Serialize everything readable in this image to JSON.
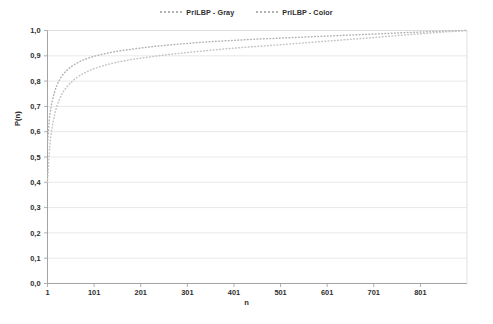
{
  "chart_data": {
    "type": "line",
    "title": "",
    "xlabel": "n",
    "ylabel": "P(n)",
    "xlim": [
      1,
      901
    ],
    "ylim": [
      0.0,
      1.0
    ],
    "grid": "horizontal",
    "legend_position": "top-center",
    "xticks": [
      "1",
      "101",
      "201",
      "301",
      "401",
      "501",
      "601",
      "701",
      "801"
    ],
    "xtick_values": [
      1,
      101,
      201,
      301,
      401,
      501,
      601,
      701,
      801
    ],
    "yticks": [
      "0,0",
      "0,1",
      "0,2",
      "0,3",
      "0,4",
      "0,5",
      "0,6",
      "0,7",
      "0,8",
      "0,9",
      "1,0"
    ],
    "ytick_values": [
      0.0,
      0.1,
      0.2,
      0.3,
      0.4,
      0.5,
      0.6,
      0.7,
      0.8,
      0.9,
      1.0
    ],
    "line_style": "dotted",
    "series": [
      {
        "name": "PriLBP - Gray",
        "color": "#b2b2b2",
        "x": [
          1,
          6,
          11,
          21,
          31,
          41,
          51,
          61,
          81,
          101,
          121,
          151,
          181,
          211,
          251,
          301,
          351,
          401,
          451,
          501,
          551,
          601,
          651,
          701,
          751,
          801,
          851,
          901
        ],
        "values": [
          0.555,
          0.665,
          0.72,
          0.783,
          0.818,
          0.84,
          0.856,
          0.868,
          0.886,
          0.898,
          0.907,
          0.918,
          0.926,
          0.933,
          0.941,
          0.949,
          0.956,
          0.961,
          0.966,
          0.97,
          0.974,
          0.978,
          0.982,
          0.986,
          0.99,
          0.994,
          0.997,
          1.0
        ]
      },
      {
        "name": "PriLBP - Color",
        "color": "#c4c4c4",
        "x": [
          1,
          6,
          11,
          21,
          31,
          41,
          51,
          61,
          81,
          101,
          121,
          151,
          181,
          211,
          251,
          301,
          351,
          401,
          451,
          501,
          551,
          601,
          651,
          701,
          751,
          801,
          851,
          901
        ],
        "values": [
          0.4,
          0.545,
          0.618,
          0.7,
          0.745,
          0.774,
          0.794,
          0.81,
          0.833,
          0.849,
          0.861,
          0.875,
          0.885,
          0.893,
          0.903,
          0.913,
          0.922,
          0.93,
          0.937,
          0.944,
          0.951,
          0.958,
          0.965,
          0.972,
          0.98,
          0.987,
          0.994,
          1.0
        ]
      }
    ]
  },
  "legend": {
    "items": [
      {
        "label": "PriLBP - Gray"
      },
      {
        "label": "PriLBP - Color"
      }
    ]
  },
  "axes": {
    "x_title": "n",
    "y_title": "P(n)"
  }
}
